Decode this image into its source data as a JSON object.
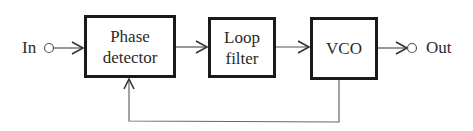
{
  "diagram": {
    "type": "block-diagram",
    "input_label": "In",
    "output_label": "Out",
    "blocks": [
      {
        "id": "phase-detector",
        "line1": "Phase",
        "line2": "detector"
      },
      {
        "id": "loop-filter",
        "line1": "Loop",
        "line2": "filter"
      },
      {
        "id": "vco",
        "line1": "VCO",
        "line2": ""
      }
    ],
    "connections": [
      {
        "from": "In",
        "to": "phase-detector"
      },
      {
        "from": "phase-detector",
        "to": "loop-filter"
      },
      {
        "from": "loop-filter",
        "to": "vco"
      },
      {
        "from": "vco",
        "to": "Out"
      },
      {
        "from": "vco",
        "to": "phase-detector",
        "kind": "feedback"
      }
    ],
    "colors": {
      "stroke": "#1a1a1a",
      "line": "#555555",
      "background": "#ffffff"
    }
  }
}
